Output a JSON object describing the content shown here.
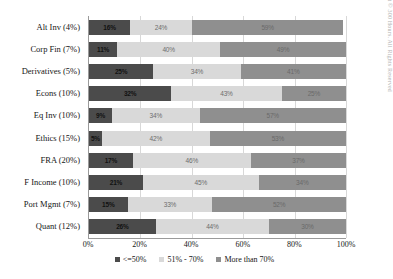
{
  "chart_data": {
    "type": "bar",
    "orientation": "horizontal",
    "stacked": true,
    "title": "",
    "xlabel": "",
    "ylabel": "",
    "xlim": [
      0,
      100
    ],
    "xticks": [
      "0%",
      "20%",
      "40%",
      "60%",
      "80%",
      "100%"
    ],
    "grid": true,
    "legend_position": "bottom",
    "categories": [
      "Alt Inv (4%)",
      "Corp Fin (7%)",
      "Derivatives (5%)",
      "Econs (10%)",
      "Eq Inv (10%)",
      "Ethics (15%)",
      "FRA (20%)",
      "F Income (10%)",
      "Port Mgmt (7%)",
      "Quant (12%)"
    ],
    "series": [
      {
        "name": "<=50%",
        "color": "#4b4b4b",
        "values": [
          16,
          11,
          25,
          32,
          9,
          5,
          17,
          21,
          15,
          26
        ],
        "labels": [
          "16%",
          "11%",
          "25%",
          "32%",
          "9%",
          "5%",
          "17%",
          "21%",
          "15%",
          "26%"
        ]
      },
      {
        "name": "51% - 70%",
        "color": "#d9d9d9",
        "values": [
          24,
          40,
          34,
          43,
          34,
          42,
          46,
          45,
          33,
          44
        ],
        "labels": [
          "24%",
          "40%",
          "34%",
          "43%",
          "34%",
          "42%",
          "46%",
          "45%",
          "33%",
          "44%"
        ]
      },
      {
        "name": "More than 70%",
        "color": "#8f8f8f",
        "values": [
          59,
          49,
          41,
          25,
          57,
          53,
          37,
          34,
          52,
          30
        ],
        "labels": [
          "59%",
          "49%",
          "41%",
          "25%",
          "57%",
          "53%",
          "37%",
          "34%",
          "52%",
          "30%"
        ]
      }
    ]
  },
  "watermark": "Copyright © 300 Hours. All Rights Reserved"
}
